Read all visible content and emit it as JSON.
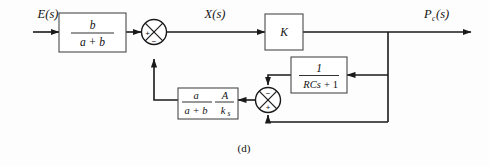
{
  "figure": {
    "caption": "(d)",
    "type": "control-system-block-diagram"
  },
  "signals": {
    "input_label": "E(s)",
    "mid_label": "X(s)",
    "output_label": "P",
    "output_sub": "c",
    "output_tail": "(s)"
  },
  "blocks": {
    "input_gain": {
      "numerator": "b",
      "denominator": "a + b"
    },
    "forward_gain": {
      "label": "K"
    },
    "lag_filter": {
      "numerator": "1",
      "denominator_a": "RCs",
      "denominator_b": "+ 1"
    },
    "feedback_gain": {
      "num_left": "a",
      "den_left": "a + b",
      "num_right": "A",
      "den_right": "k",
      "den_right_sub": "s"
    }
  },
  "summers": {
    "top": {
      "name": "top-summing-junction",
      "left_sign": "+",
      "bottom_sign": "−"
    },
    "bottom": {
      "name": "bottom-summing-junction",
      "top_sign": "−",
      "bottom_sign": "+"
    }
  },
  "colors": {
    "wire": "#1a1a1a",
    "block_stroke": "#4a4a4a",
    "background": "#fdfdfd",
    "text": "#111111"
  }
}
